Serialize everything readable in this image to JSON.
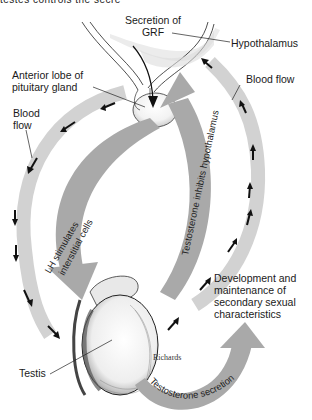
{
  "figure": {
    "top_cutoff_text": "testes controls the secre",
    "labels": {
      "grf": [
        "Secretion of",
        "GRF"
      ],
      "hypothalamus": "Hypothalamus",
      "anterior_lobe": [
        "Anterior lobe of",
        "pituitary gland"
      ],
      "blood_flow_right": "Blood flow",
      "blood_flow_left": [
        "Blood",
        "flow"
      ],
      "development": [
        "Development and",
        "maintenance of",
        "secondary sexual",
        "characteristics"
      ],
      "testis": "Testis",
      "credit": "Richards"
    },
    "arrow_texts": {
      "lh": "LH stimulates",
      "lh2": "interstitial cells",
      "inhibits": "Testosterone inhibits hypothalamus",
      "secretion": "Testosterone secretion"
    },
    "colors": {
      "arrow_fill": "#a9a9a9",
      "blood_band": "#d2d2d2",
      "ink": "#1a1a1a",
      "background": "#ffffff"
    }
  }
}
